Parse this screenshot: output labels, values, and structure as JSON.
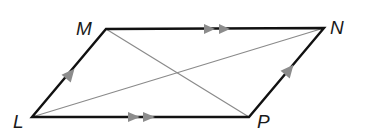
{
  "figure": {
    "type": "parallelogram",
    "vertices": {
      "L": {
        "label": "L",
        "x": 32,
        "y": 117
      },
      "M": {
        "label": "M",
        "x": 106,
        "y": 29
      },
      "N": {
        "label": "N",
        "x": 324,
        "y": 28
      },
      "P": {
        "label": "P",
        "x": 249,
        "y": 117
      }
    },
    "sides": [
      {
        "from": "L",
        "to": "M",
        "marks": 1
      },
      {
        "from": "M",
        "to": "N",
        "marks": 2
      },
      {
        "from": "P",
        "to": "N",
        "marks": 1
      },
      {
        "from": "L",
        "to": "P",
        "marks": 2
      }
    ],
    "diagonals": [
      {
        "from": "L",
        "to": "N"
      },
      {
        "from": "M",
        "to": "P"
      }
    ],
    "colors": {
      "side": "#111111",
      "diagonal": "#8a8a8a",
      "arrow": "#8c8c8c"
    }
  }
}
